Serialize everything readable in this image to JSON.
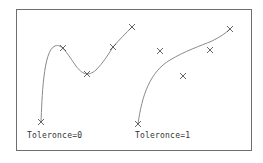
{
  "diagram": {
    "stroke_color": "#8a8a8a",
    "marker_color": "#555555",
    "panels": [
      {
        "label": "Toleronce=0",
        "fit_points": [
          [
            41,
            122
          ],
          [
            63,
            48
          ],
          [
            87,
            74
          ],
          [
            113,
            47
          ],
          [
            132,
            27
          ]
        ],
        "curve_path": "M41,122 C42,100 43,50 55,46 C62,43 68,55 76,66 C82,74 88,77 96,70 C103,63 108,55 113,47 C119,40 126,33 132,27"
      },
      {
        "label": "Toleronce=1",
        "fit_points": [
          [
            138,
            124
          ],
          [
            160,
            51
          ],
          [
            183,
            76
          ],
          [
            210,
            50
          ],
          [
            230,
            29
          ]
        ],
        "curve_path": "M138,124 C142,95 150,72 170,60 C185,51 200,46 212,41 C220,37 226,33 230,29"
      }
    ]
  }
}
